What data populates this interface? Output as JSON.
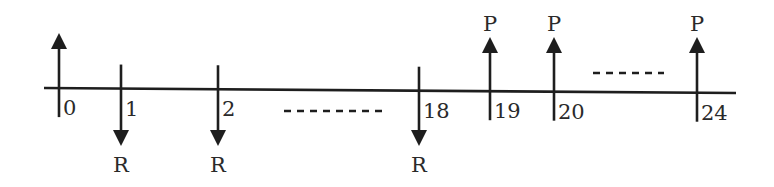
{
  "diagram": {
    "type": "cash-flow-timeline",
    "axis": {
      "x_start": 44,
      "x_end": 736,
      "y_start": 88,
      "y_end": 93
    },
    "periods": [
      {
        "label": "0",
        "x": 59,
        "arrow": "up",
        "arrow_label": ""
      },
      {
        "label": "1",
        "x": 121,
        "arrow": "down",
        "arrow_label": "R"
      },
      {
        "label": "2",
        "x": 218,
        "arrow": "down",
        "arrow_label": "R"
      },
      {
        "label": "18",
        "x": 419,
        "arrow": "down",
        "arrow_label": "R"
      },
      {
        "label": "19",
        "x": 490,
        "arrow": "up",
        "arrow_label": "P"
      },
      {
        "label": "20",
        "x": 554,
        "arrow": "up",
        "arrow_label": "P"
      },
      {
        "label": "24",
        "x": 697,
        "arrow": "up",
        "arrow_label": "P"
      }
    ],
    "ellipses": [
      {
        "name": "ellipsis-periods-3-to-17",
        "x1": 284,
        "x2": 382,
        "y": 111
      },
      {
        "name": "ellipsis-periods-21-to-23",
        "x1": 593,
        "x2": 664,
        "y": 73
      }
    ],
    "labels": {
      "receipt": "R",
      "payment": "P"
    }
  }
}
